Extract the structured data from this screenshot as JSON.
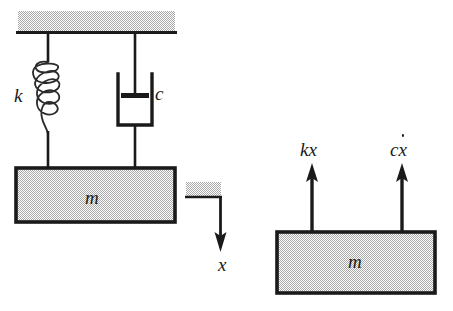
{
  "figure": {
    "colors": {
      "ink": "#1a1a1a",
      "hatch_fill": "#c9c9c9",
      "background": "#ffffff"
    }
  },
  "system_diagram": {
    "name": "spring-mass-damper-system",
    "ceiling_label": "",
    "spring_label": "k",
    "damper_label": "c",
    "mass_label": "m",
    "displacement_label": "x",
    "spring_coils": 5
  },
  "free_body_diagram": {
    "name": "free-body-diagram",
    "mass_label": "m",
    "force_spring": "kx",
    "force_damper_base": "c",
    "force_damper_var": "x",
    "force_damper_full": "cẋ"
  }
}
